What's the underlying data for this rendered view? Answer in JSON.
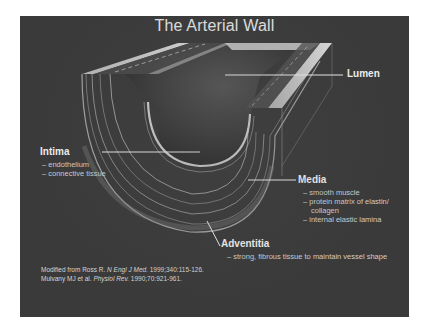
{
  "slide": {
    "title": "The Arterial Wall",
    "labels": {
      "lumen": {
        "title": "Lumen"
      },
      "intima": {
        "title": "Intima",
        "items": [
          "– endothelium",
          "– connective tissue"
        ]
      },
      "media": {
        "title": "Media",
        "items": [
          "– smooth muscle",
          "– protein matrix of elastin/",
          "   collagen",
          "– internal elastic lamina"
        ]
      },
      "adventitia": {
        "title": "Adventitia",
        "items": [
          "– strong, fibrous tissue to maintain vessel shape"
        ]
      }
    },
    "references": [
      {
        "prefix": "Modified from Ross R. ",
        "journal": "N Engl J Med.",
        "suffix": " 1999;340:115-126."
      },
      {
        "prefix": "Mulvany MJ et al. ",
        "journal": "Physiol Rev.",
        "suffix": " 1990;70:921-961."
      }
    ],
    "colors": {
      "background": "#3a3a3a",
      "text": "#f2f2f2",
      "subtext": "#cfcfcf"
    }
  }
}
